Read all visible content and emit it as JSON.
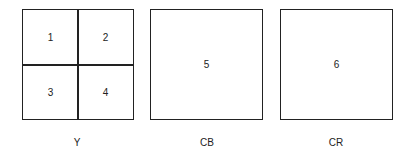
{
  "diagram": {
    "components": [
      {
        "name": "Y",
        "blocks": [
          "1",
          "2",
          "3",
          "4"
        ]
      },
      {
        "name": "CB",
        "blocks": [
          "5"
        ]
      },
      {
        "name": "CR",
        "blocks": [
          "6"
        ]
      }
    ],
    "line_color": "#222222"
  }
}
